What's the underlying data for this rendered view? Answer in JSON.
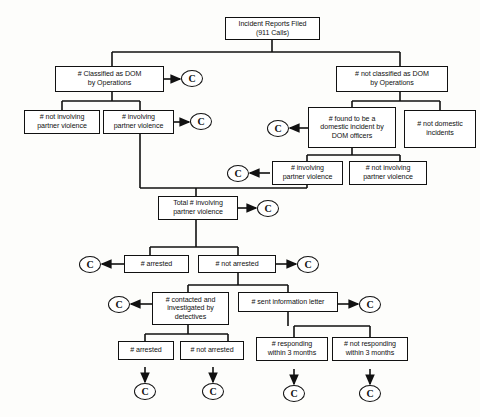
{
  "diagram": {
    "marker_label": "C",
    "stroke_color": "#111111",
    "background_color": "#fdfdfb",
    "nodes": [
      {
        "id": "n1",
        "label": "Incident Reports Filed\n(911 Calls)",
        "line1": "Incident Reports Filed",
        "line2": "(911 Calls)",
        "line3": ""
      },
      {
        "id": "n2",
        "label": "# Classified as DOM by Operations",
        "line1": "# Classified as DOM",
        "line2": "by Operations",
        "line3": ""
      },
      {
        "id": "n3",
        "label": "# not classified as DOM by Operations",
        "line1": "# not classified as DOM",
        "line2": "by Operations",
        "line3": ""
      },
      {
        "id": "n4",
        "label": "# not involving partner violence",
        "line1": "# not involving",
        "line2": "partner violence",
        "line3": ""
      },
      {
        "id": "n5",
        "label": "# involving partner violence",
        "line1": "# involving",
        "line2": "partner violence",
        "line3": ""
      },
      {
        "id": "n6",
        "label": "# found to be a domestic incident by DOM officers",
        "line1": "# found to be a",
        "line2": "domestic incident by",
        "line3": "DOM officers"
      },
      {
        "id": "n7",
        "label": "# not domestic incidents",
        "line1": "# not domestic",
        "line2": "incidents",
        "line3": ""
      },
      {
        "id": "n8",
        "label": "# involving partner violence",
        "line1": "# involving",
        "line2": "partner violence",
        "line3": ""
      },
      {
        "id": "n9",
        "label": "# not involving partner violence",
        "line1": "# not involving",
        "line2": "partner violence",
        "line3": ""
      },
      {
        "id": "n10",
        "label": "Total # involving partner violence",
        "line1": "Total # involving",
        "line2": "partner violence",
        "line3": ""
      },
      {
        "id": "n11",
        "label": "# arrested",
        "line1": "# arrested",
        "line2": "",
        "line3": ""
      },
      {
        "id": "n12",
        "label": "# not arrested",
        "line1": "# not arrested",
        "line2": "",
        "line3": ""
      },
      {
        "id": "n13",
        "label": "# contacted and investigated by detectives",
        "line1": "# contacted and",
        "line2": "investigated by",
        "line3": "detectives"
      },
      {
        "id": "n14",
        "label": "# sent information letter",
        "line1": "# sent information letter",
        "line2": "",
        "line3": ""
      },
      {
        "id": "n15",
        "label": "# arrested",
        "line1": "# arrested",
        "line2": "",
        "line3": ""
      },
      {
        "id": "n16",
        "label": "# not arrested",
        "line1": "# not arrested",
        "line2": "",
        "line3": ""
      },
      {
        "id": "n17",
        "label": "# responding within 3 months",
        "line1": "# responding",
        "line2": "within 3 months",
        "line3": ""
      },
      {
        "id": "n18",
        "label": "# not responding within 3 months",
        "line1": "# not responding",
        "line2": "within 3 months",
        "line3": ""
      }
    ],
    "markers": [
      {
        "id": "c1",
        "label": "C",
        "attached_to": "n2",
        "direction": "right"
      },
      {
        "id": "c2",
        "label": "C",
        "attached_to": "n5",
        "direction": "right"
      },
      {
        "id": "c3",
        "label": "C",
        "attached_to": "n6",
        "direction": "left"
      },
      {
        "id": "c4",
        "label": "C",
        "attached_to": "n8",
        "direction": "left"
      },
      {
        "id": "c5",
        "label": "C",
        "attached_to": "n10",
        "direction": "right"
      },
      {
        "id": "c6",
        "label": "C",
        "attached_to": "n11",
        "direction": "left"
      },
      {
        "id": "c7",
        "label": "C",
        "attached_to": "n12",
        "direction": "right"
      },
      {
        "id": "c8",
        "label": "C",
        "attached_to": "n13",
        "direction": "left"
      },
      {
        "id": "c9",
        "label": "C",
        "attached_to": "n14",
        "direction": "right"
      },
      {
        "id": "c10",
        "label": "C",
        "attached_to": "n15",
        "direction": "down"
      },
      {
        "id": "c11",
        "label": "C",
        "attached_to": "n16",
        "direction": "down"
      },
      {
        "id": "c12",
        "label": "C",
        "attached_to": "n17",
        "direction": "down"
      },
      {
        "id": "c13",
        "label": "C",
        "attached_to": "n18",
        "direction": "down"
      }
    ]
  }
}
